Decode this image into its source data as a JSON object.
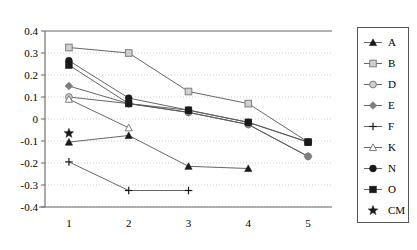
{
  "chart_data": {
    "type": "line",
    "title": "",
    "xlabel": "",
    "ylabel": "",
    "x": [
      1,
      2,
      3,
      4,
      5
    ],
    "xtick_labels": [
      "1",
      "2",
      "3",
      "4",
      "5"
    ],
    "ytick_labels": [
      "0.4",
      "0.3",
      "0.2",
      "0.1",
      "0",
      "-0.1",
      "-0.2",
      "-0.3",
      "-0.4"
    ],
    "ytick_values": [
      0.4,
      0.3,
      0.2,
      0.1,
      0,
      -0.1,
      -0.2,
      -0.3,
      -0.4
    ],
    "ylim": [
      -0.4,
      0.4
    ],
    "xlim": [
      0.6,
      5.4
    ],
    "grid": true,
    "legend_position": "right",
    "series": [
      {
        "name": "A",
        "marker": "filled-triangle",
        "x": [
          1,
          2,
          3,
          4
        ],
        "values": [
          -0.105,
          -0.075,
          -0.215,
          -0.225
        ]
      },
      {
        "name": "B",
        "marker": "open-square",
        "x": [
          1,
          2,
          3,
          4,
          5
        ],
        "values": [
          0.325,
          0.3,
          0.125,
          0.07,
          -0.105
        ]
      },
      {
        "name": "D",
        "marker": "open-circle",
        "x": [
          1,
          2,
          3,
          4,
          5
        ],
        "values": [
          0.1,
          0.07,
          0.03,
          -0.025,
          -0.17
        ]
      },
      {
        "name": "E",
        "marker": "filled-diamond",
        "x": [
          1,
          2,
          3,
          4,
          5
        ],
        "values": [
          0.15,
          0.07,
          0.03,
          -0.025,
          -0.17
        ]
      },
      {
        "name": "F",
        "marker": "plus",
        "x": [
          1,
          2,
          3
        ],
        "values": [
          -0.195,
          -0.325,
          -0.325
        ]
      },
      {
        "name": "K",
        "marker": "open-triangle",
        "x": [
          1,
          2
        ],
        "values": [
          0.09,
          -0.04
        ]
      },
      {
        "name": "N",
        "marker": "filled-circle",
        "x": [
          1,
          2,
          3,
          4,
          5
        ],
        "values": [
          0.265,
          0.095,
          0.04,
          -0.015,
          -0.105
        ]
      },
      {
        "name": "O",
        "marker": "filled-square",
        "x": [
          1,
          2,
          3,
          4,
          5
        ],
        "values": [
          0.245,
          0.07,
          0.04,
          -0.015,
          -0.105
        ]
      },
      {
        "name": "CM",
        "marker": "filled-star",
        "x": [
          1
        ],
        "values": [
          -0.065
        ],
        "line": false
      }
    ]
  },
  "legend": {
    "entries": [
      {
        "label": "A",
        "marker": "filled-triangle",
        "line": true
      },
      {
        "label": "B",
        "marker": "open-square",
        "line": true
      },
      {
        "label": "D",
        "marker": "open-circle",
        "line": true
      },
      {
        "label": "E",
        "marker": "filled-diamond",
        "line": true
      },
      {
        "label": "F",
        "marker": "plus",
        "line": true
      },
      {
        "label": "K",
        "marker": "open-triangle",
        "line": true
      },
      {
        "label": "N",
        "marker": "filled-circle",
        "line": true
      },
      {
        "label": "O",
        "marker": "filled-square",
        "line": true
      },
      {
        "label": "CM",
        "marker": "filled-star",
        "line": false
      }
    ]
  },
  "colors": {
    "axis": "#666666",
    "grid": "#cfcfcf",
    "line": "#555555",
    "marker_dark": "#1a1a1a",
    "marker_mid": "#7d7d7d",
    "marker_open_fill": "#d0d0d0",
    "text": "#000000"
  }
}
